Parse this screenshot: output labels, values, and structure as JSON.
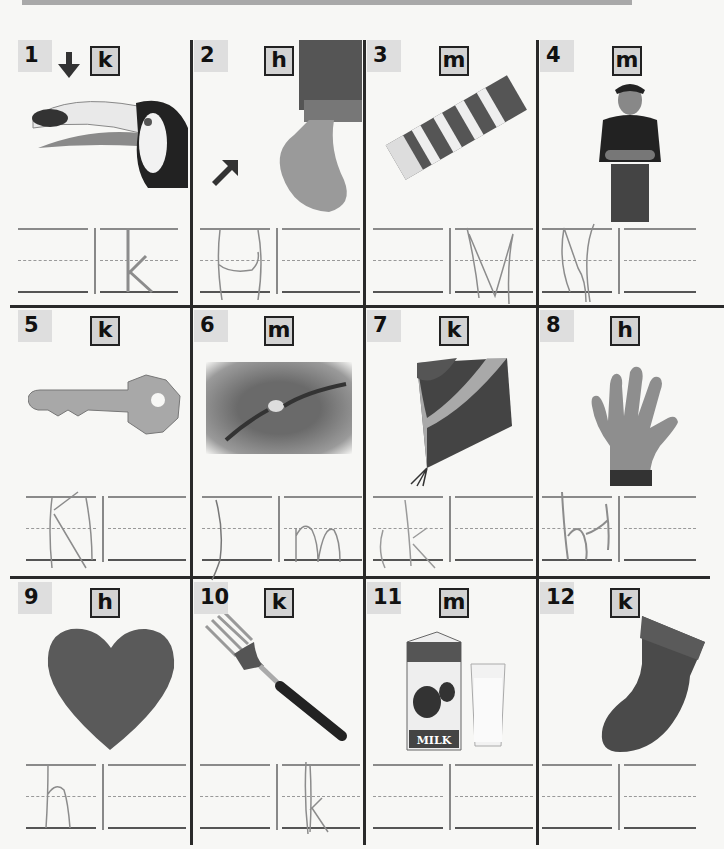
{
  "worksheet": {
    "instructions_visible": false,
    "cells": [
      {
        "number": "1",
        "letter": "k",
        "picture": "toucan",
        "pointer": "down-arrow",
        "traced": [
          "",
          "k"
        ]
      },
      {
        "number": "2",
        "letter": "h",
        "picture": "heel of foot",
        "pointer": "up-right-arrow",
        "traced": [
          "h",
          ""
        ]
      },
      {
        "number": "3",
        "letter": "m",
        "picture": "gum",
        "traced": [
          "",
          "m"
        ]
      },
      {
        "number": "4",
        "letter": "m",
        "picture": "man",
        "traced": [
          "m",
          ""
        ]
      },
      {
        "number": "5",
        "letter": "k",
        "picture": "key",
        "traced": [
          "k",
          ""
        ]
      },
      {
        "number": "6",
        "letter": "m",
        "picture": "swimmer",
        "traced": [
          "",
          "m"
        ]
      },
      {
        "number": "7",
        "letter": "k",
        "picture": "kite",
        "traced": [
          "k",
          ""
        ]
      },
      {
        "number": "8",
        "letter": "h",
        "picture": "hand",
        "traced": [
          "h",
          ""
        ]
      },
      {
        "number": "9",
        "letter": "h",
        "picture": "heart",
        "traced": [
          "h",
          ""
        ]
      },
      {
        "number": "10",
        "letter": "k",
        "picture": "fork",
        "traced": [
          "",
          "k"
        ]
      },
      {
        "number": "11",
        "letter": "m",
        "picture": "milk",
        "traced": [
          "",
          ""
        ],
        "carton_text": "MILK"
      },
      {
        "number": "12",
        "letter": "k",
        "picture": "sock",
        "traced": [
          "",
          ""
        ]
      }
    ]
  },
  "colors": {
    "rule": "#2a2a2a",
    "number_bg": "#dedede",
    "letter_bg": "#d3d3d3",
    "pencil": "#8c8c8c"
  }
}
